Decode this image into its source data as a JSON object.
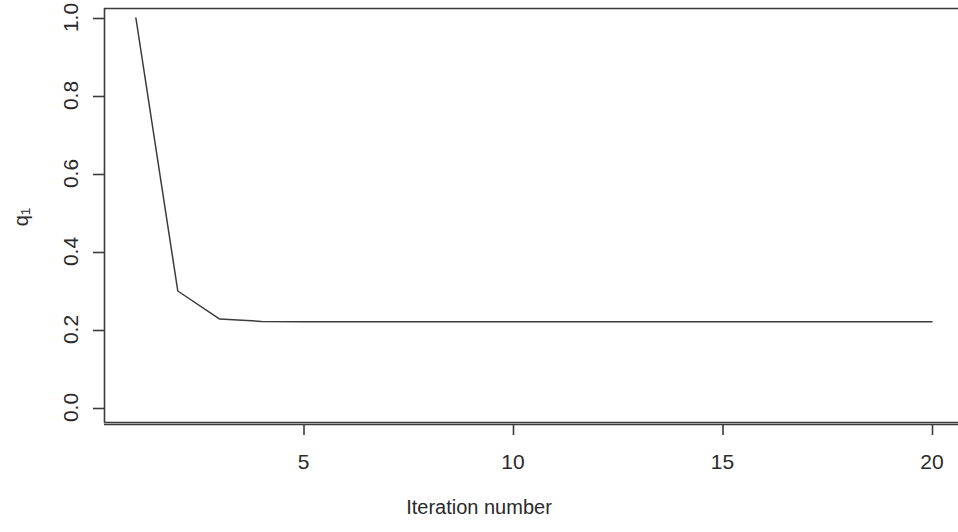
{
  "chart_data": {
    "type": "line",
    "title": "",
    "subtitle": "",
    "xlabel": "Iteration number",
    "ylabel": "q1",
    "ylabel_base": "q",
    "ylabel_sub": "1",
    "x": [
      1,
      2,
      3,
      4,
      5,
      6,
      7,
      8,
      9,
      10,
      11,
      12,
      13,
      14,
      15,
      16,
      17,
      18,
      19,
      20
    ],
    "values": [
      1.0,
      0.3,
      0.228,
      0.222,
      0.221,
      0.221,
      0.221,
      0.221,
      0.221,
      0.221,
      0.221,
      0.221,
      0.221,
      0.221,
      0.221,
      0.221,
      0.221,
      0.221,
      0.221,
      0.221
    ],
    "series": [
      {
        "name": "q1",
        "values": [
          1.0,
          0.3,
          0.228,
          0.222,
          0.221,
          0.221,
          0.221,
          0.221,
          0.221,
          0.221,
          0.221,
          0.221,
          0.221,
          0.221,
          0.221,
          0.221,
          0.221,
          0.221,
          0.221,
          0.221
        ]
      }
    ],
    "xlim": [
      0.5,
      20.5
    ],
    "ylim": [
      -0.04,
      1.04
    ],
    "xticks": [
      5,
      10,
      15,
      20
    ],
    "xtick_labels": [
      "5",
      "10",
      "15",
      "20"
    ],
    "yticks": [
      0.0,
      0.2,
      0.4,
      0.6,
      0.8,
      1.0
    ],
    "ytick_labels": [
      "0.0",
      "0.2",
      "0.4",
      "0.6",
      "0.8",
      "1.0"
    ],
    "grid": false,
    "legend": false,
    "legend_position": "none",
    "line_color": "#3b3b3b",
    "axis_color": "#3b3b3b",
    "background": "#ffffff",
    "annotations": []
  }
}
